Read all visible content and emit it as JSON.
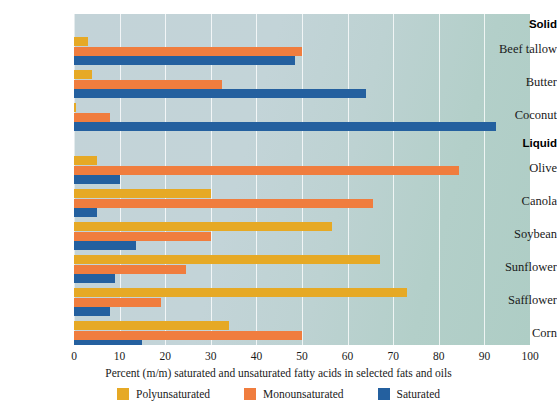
{
  "chart_data": {
    "type": "bar",
    "orientation": "horizontal",
    "title": "",
    "xlabel": "Percent (m/m) saturated and unsaturated fatty acids in selected fats and oils",
    "ylabel": "",
    "xlim": [
      0,
      100
    ],
    "xticks": [
      0,
      10,
      20,
      30,
      40,
      50,
      60,
      70,
      80,
      90,
      100
    ],
    "xtick_labels": [
      "0",
      "10",
      "20",
      "30",
      "40",
      "50",
      "60",
      "70",
      "80",
      "90",
      "100"
    ],
    "grid": true,
    "legend_position": "bottom",
    "group_headers": [
      "Solid",
      "Liquid"
    ],
    "groups": [
      {
        "name": "Solid",
        "categories": [
          "Beef tallow",
          "Butter",
          "Coconut"
        ]
      },
      {
        "name": "Liquid",
        "categories": [
          "Olive",
          "Canola",
          "Soybean",
          "Sunflower",
          "Safflower",
          "Corn"
        ]
      }
    ],
    "categories": [
      "Beef tallow",
      "Butter",
      "Coconut",
      "Olive",
      "Canola",
      "Soybean",
      "Sunflower",
      "Safflower",
      "Corn"
    ],
    "series": [
      {
        "name": "Polyunsaturated",
        "color": "#e6a925",
        "values": [
          3,
          4,
          0.5,
          5,
          30,
          56.5,
          67,
          73,
          34
        ]
      },
      {
        "name": "Monounsaturated",
        "color": "#f07d3e",
        "values": [
          50,
          32.5,
          8,
          84.5,
          65.5,
          30,
          24.5,
          19,
          50
        ]
      },
      {
        "name": "Saturated",
        "color": "#24609f",
        "values": [
          48.5,
          64,
          92.5,
          10,
          5,
          13.5,
          9,
          8,
          15
        ]
      }
    ]
  },
  "legend": {
    "items": [
      {
        "label": "Polyunsaturated",
        "color": "#e6a925",
        "swatch_name": "legend-swatch-polyunsaturated"
      },
      {
        "label": "Monounsaturated",
        "color": "#f07d3e",
        "swatch_name": "legend-swatch-monounsaturated"
      },
      {
        "label": "Saturated",
        "color": "#24609f",
        "swatch_name": "legend-swatch-saturated"
      }
    ]
  },
  "axis": {
    "title": "Percent (m/m) saturated and unsaturated fatty acids in selected fats and oils"
  }
}
